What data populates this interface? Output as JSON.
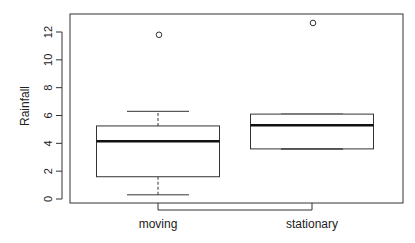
{
  "chart_data": {
    "type": "boxplot",
    "title": "",
    "xlabel": "",
    "ylabel": "Rainfall",
    "ylim": [
      0,
      13.2
    ],
    "yticks": [
      0,
      2,
      4,
      6,
      8,
      10,
      12
    ],
    "ytick_labels": [
      "0",
      "2",
      "4",
      "6",
      "8",
      "10",
      "12"
    ],
    "categories": [
      "moving",
      "stationary"
    ],
    "series": [
      {
        "name": "moving",
        "whisker_low": 0.3,
        "q1": 1.6,
        "median": 4.15,
        "q3": 5.25,
        "whisker_high": 6.3,
        "outliers": [
          11.8
        ]
      },
      {
        "name": "stationary",
        "whisker_low": 3.6,
        "q1": 3.6,
        "median": 5.3,
        "q3": 6.1,
        "whisker_high": 6.1,
        "outliers": [
          12.65
        ]
      }
    ],
    "grid": false,
    "legend": "none"
  }
}
